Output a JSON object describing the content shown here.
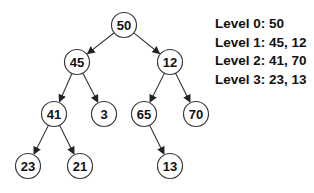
{
  "diagram": {
    "type": "binary-tree",
    "node_radius": 12.5,
    "nodes": [
      {
        "id": "n50",
        "value": "50",
        "x": 124,
        "y": 25,
        "level": 0
      },
      {
        "id": "n45",
        "value": "45",
        "x": 77,
        "y": 62,
        "level": 1
      },
      {
        "id": "n12",
        "value": "12",
        "x": 170,
        "y": 62,
        "level": 1
      },
      {
        "id": "n41",
        "value": "41",
        "x": 54,
        "y": 114,
        "level": 2
      },
      {
        "id": "n3",
        "value": "3",
        "x": 104,
        "y": 114,
        "level": 2
      },
      {
        "id": "n65",
        "value": "65",
        "x": 144,
        "y": 114,
        "level": 2
      },
      {
        "id": "n70",
        "value": "70",
        "x": 196,
        "y": 114,
        "level": 2
      },
      {
        "id": "n23",
        "value": "23",
        "x": 28,
        "y": 166,
        "level": 3
      },
      {
        "id": "n21",
        "value": "21",
        "x": 80,
        "y": 166,
        "level": 3
      },
      {
        "id": "n13",
        "value": "13",
        "x": 170,
        "y": 166,
        "level": 3
      }
    ],
    "edges": [
      {
        "from": "n50",
        "to": "n45"
      },
      {
        "from": "n50",
        "to": "n12"
      },
      {
        "from": "n45",
        "to": "n41"
      },
      {
        "from": "n45",
        "to": "n3"
      },
      {
        "from": "n12",
        "to": "n65"
      },
      {
        "from": "n12",
        "to": "n70"
      },
      {
        "from": "n41",
        "to": "n23"
      },
      {
        "from": "n41",
        "to": "n21"
      },
      {
        "from": "n65",
        "to": "n13"
      }
    ]
  },
  "legend": {
    "lines": [
      "Level 0: 50",
      "Level 1: 45, 12",
      "Level 2: 41, 70",
      "Level 3: 23, 13"
    ]
  }
}
